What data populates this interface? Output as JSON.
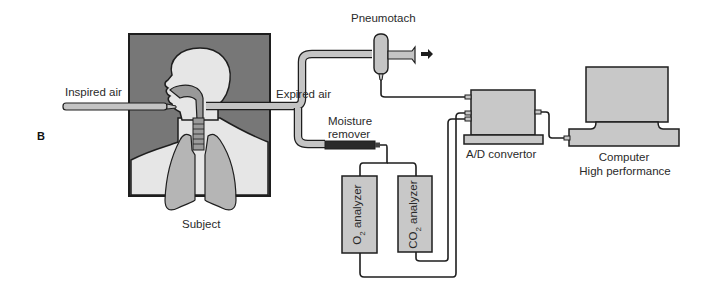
{
  "figure": {
    "panel_letter": "B",
    "labels": {
      "inspired_air": "Inspired air",
      "expired_air": "Expired air",
      "pneumotach": "Pneumotach",
      "moisture_remover_line1": "Moisture",
      "moisture_remover_line2": "remover",
      "subject": "Subject",
      "ad_convertor": "A/D convertor",
      "computer_line1": "Computer",
      "computer_line2": "High performance",
      "o2_analyzer_prefix": "O",
      "o2_analyzer_sub": "2",
      "o2_analyzer_suffix": " analyzer",
      "co2_analyzer_prefix": "CO",
      "co2_analyzer_sub": "2",
      "co2_analyzer_suffix": " analyzer"
    },
    "colors": {
      "background_dark": "#777777",
      "body_light": "#e6e6e6",
      "lungs": "#b5b5b5",
      "tube": "#c4c4c4",
      "device": "#c8c8c8",
      "outline": "#1e1e1e",
      "moisture_remover": "#2a2a2a"
    }
  }
}
